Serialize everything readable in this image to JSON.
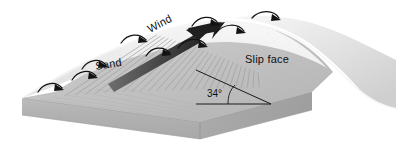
{
  "figure": {
    "type": "block-diagram",
    "background_color": "#ffffff"
  },
  "labels": {
    "wind": "Wind",
    "sand": "Sand",
    "slip_face": "Slip face",
    "angle": "34°",
    "angle_value": 34,
    "angle_unit": "degrees"
  },
  "colors": {
    "background": "#ffffff",
    "block_front_face": "#b0b0b0",
    "block_right_face": "#a6a6a6",
    "block_top": "#bcbcbc",
    "windward_slope": "#e9e9e9",
    "lee_slope": "#c6c6c6",
    "crest_highlight": "#f2f2f2",
    "slip_face_shade": "#b8b8b8",
    "arrow_dark": "#1a1a1a",
    "wind_arrow": "#4a4a4a",
    "ripple_line": "#9a9a9a",
    "text": "#111111"
  },
  "elements": {
    "wind_arrow": {
      "name": "wind-arrow",
      "description": "thick tapered arrow running up the windward slope to the crest"
    },
    "saltation_arrows": {
      "name": "saltation-arrows",
      "count": 9,
      "description": "small curved hopping arrows showing saltating sand grains"
    },
    "slip_face_ripples": {
      "name": "slip-face-ripple-lines",
      "count": 26,
      "description": "radiating avalanche striations on the lee slip face"
    },
    "angle_marker": {
      "name": "angle-of-repose-marker",
      "description": "horizontal baseline, slope line and arc marking the 34 degree angle of repose"
    }
  }
}
